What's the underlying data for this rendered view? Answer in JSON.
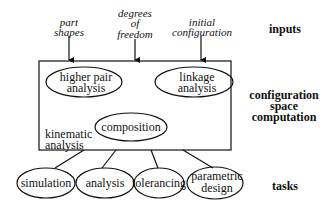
{
  "diagram": {
    "inputs": [
      {
        "lines": [
          "part",
          "shapes"
        ]
      },
      {
        "lines": [
          "degrees",
          "of",
          "freedom"
        ]
      },
      {
        "lines": [
          "initial",
          "configuration"
        ]
      }
    ],
    "box": {
      "label_lines": [
        "kinematic",
        "analysis"
      ],
      "nodes": [
        {
          "lines": [
            "higher pair",
            "analysis"
          ]
        },
        {
          "lines": [
            "linkage",
            "analysis"
          ]
        },
        {
          "lines": [
            "composition"
          ]
        }
      ]
    },
    "tasks": [
      {
        "lines": [
          "simulation"
        ]
      },
      {
        "lines": [
          "analysis"
        ]
      },
      {
        "lines": [
          "tolerancing"
        ]
      },
      {
        "lines": [
          "parametric",
          "design"
        ]
      }
    ],
    "row_labels": {
      "inputs": [
        "inputs"
      ],
      "computation": [
        "configuration",
        "space",
        "computation"
      ],
      "tasks": [
        "tasks"
      ]
    }
  }
}
